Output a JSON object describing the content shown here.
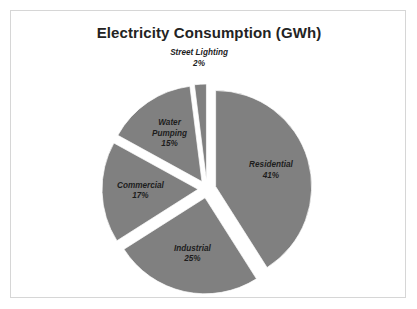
{
  "frame": {
    "border_color": "#d6d6d6",
    "background": "#ffffff"
  },
  "chart_data": {
    "type": "pie",
    "title": "Electricity Consumption (GWh)",
    "subtitle": "",
    "xlabel": "",
    "ylabel": "",
    "unit": "GWh",
    "value_unit": "percent",
    "exploded": true,
    "legend": false,
    "legend_position": "none",
    "labels_inside_slices": true,
    "start_angle_deg": 0,
    "direction": "clockwise",
    "slice_color": "#808080",
    "slice_border_color": "#ffffff",
    "label_color": "#1d1d1d",
    "categories": [
      "Residential",
      "Industrial",
      "Commercial",
      "Water Pumping",
      "Street Lighting"
    ],
    "values": [
      41,
      25,
      17,
      15,
      2
    ],
    "slices": [
      {
        "label": "Residential",
        "value": 41,
        "percent_label": "41%",
        "color": "#808080",
        "label_placement": "inside",
        "label_lines": [
          "Residential",
          "41%"
        ]
      },
      {
        "label": "Industrial",
        "value": 25,
        "percent_label": "25%",
        "color": "#808080",
        "label_placement": "inside",
        "label_lines": [
          "Industrial",
          "25%"
        ]
      },
      {
        "label": "Commercial",
        "value": 17,
        "percent_label": "17%",
        "color": "#808080",
        "label_placement": "inside",
        "label_lines": [
          "Commercial",
          "17%"
        ]
      },
      {
        "label": "Water Pumping",
        "value": 15,
        "percent_label": "15%",
        "color": "#808080",
        "label_placement": "inside",
        "label_lines": [
          "Water",
          "Pumping",
          "15%"
        ]
      },
      {
        "label": "Street Lighting",
        "value": 2,
        "percent_label": "2%",
        "color": "#808080",
        "label_placement": "outside",
        "label_lines": [
          "Street Lighting",
          "2%"
        ]
      }
    ],
    "total": 100
  },
  "geometry": {
    "center_x": 196,
    "center_y": 152,
    "radius": 96,
    "explode_offset": 9
  }
}
